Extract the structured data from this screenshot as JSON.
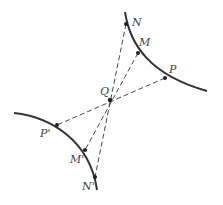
{
  "diagram": {
    "type": "hyperbola-symmetry",
    "center": {
      "label": "Q",
      "x": 110,
      "y": 100,
      "lx": 100,
      "ly": 95
    },
    "colors": {
      "curve": "#333333",
      "dashed": "#333333",
      "label": "#444444"
    },
    "upper_branch": {
      "path": "M125,12 C130,45 150,75 207,91",
      "points": [
        {
          "label": "N",
          "x": 126,
          "y": 24,
          "lx": 132,
          "ly": 26
        },
        {
          "label": "M",
          "x": 138,
          "y": 53,
          "lx": 139,
          "ly": 46
        },
        {
          "label": "P",
          "x": 165,
          "y": 78,
          "lx": 169,
          "ly": 73
        }
      ]
    },
    "lower_branch": {
      "path": "M14,113 C50,117 90,140 97,190",
      "points": [
        {
          "label": "P'",
          "x": 57,
          "y": 125,
          "lx": 40,
          "ly": 137
        },
        {
          "label": "M'",
          "x": 85,
          "y": 150,
          "lx": 70,
          "ly": 163
        },
        {
          "label": "N'",
          "x": 95,
          "y": 177,
          "lx": 82,
          "ly": 190
        }
      ]
    },
    "dashed_segments": [
      {
        "from": "N",
        "to": "N'"
      },
      {
        "from": "M",
        "to": "M'"
      },
      {
        "from": "P",
        "to": "P'"
      }
    ]
  }
}
